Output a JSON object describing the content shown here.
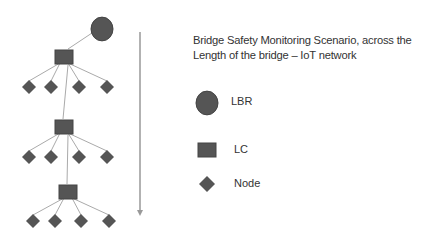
{
  "title": {
    "line1": "Bridge Safety Monitoring Scenario, across the",
    "line2": "Length of the bridge – IoT network"
  },
  "legend": {
    "items": [
      {
        "shape": "circle",
        "label": "LBR"
      },
      {
        "shape": "square",
        "label": "LC"
      },
      {
        "shape": "diamond",
        "label": "Node"
      }
    ]
  },
  "colors": {
    "shape_fill": "#555555",
    "shape_stroke": "#444444",
    "line": "#aaaaaa",
    "arrow": "#999999",
    "text": "#333333"
  },
  "network": {
    "lbr": {
      "x": 102,
      "y": 29
    },
    "clusters": [
      {
        "lc": {
          "x": 64,
          "y": 57
        },
        "nodes": [
          29,
          51,
          79,
          107
        ],
        "node_y": 87
      },
      {
        "lc": {
          "x": 64,
          "y": 127
        },
        "nodes": [
          29,
          51,
          79,
          107
        ],
        "node_y": 157
      },
      {
        "lc": {
          "x": 68,
          "y": 192
        },
        "nodes": [
          33,
          55,
          81,
          109
        ],
        "node_y": 221
      }
    ]
  },
  "arrow": {
    "x": 140,
    "y1": 32,
    "y2": 216,
    "direction": "down"
  }
}
